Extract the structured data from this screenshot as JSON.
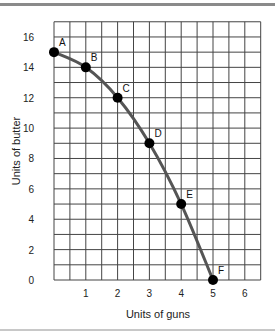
{
  "chart_data": {
    "type": "line",
    "title": "",
    "xlabel": "Units of guns",
    "ylabel": "Units of butter",
    "xlim": [
      0,
      6.5
    ],
    "ylim": [
      0,
      17
    ],
    "x_ticks": [
      1,
      2,
      3,
      4,
      5,
      6
    ],
    "y_ticks": [
      0,
      2,
      4,
      6,
      8,
      10,
      12,
      14,
      16
    ],
    "grid": true,
    "grid_x_step": 0.5,
    "grid_y_step": 1,
    "legend": null,
    "series": [
      {
        "name": "Production possibilities frontier",
        "color": "#555555",
        "points": [
          {
            "label": "A",
            "x": 0,
            "y": 15
          },
          {
            "label": "B",
            "x": 1,
            "y": 14
          },
          {
            "label": "C",
            "x": 2,
            "y": 12
          },
          {
            "label": "D",
            "x": 3,
            "y": 9
          },
          {
            "label": "E",
            "x": 4,
            "y": 5
          },
          {
            "label": "F",
            "x": 5,
            "y": 0
          }
        ]
      }
    ],
    "marker_color": "#000000"
  }
}
